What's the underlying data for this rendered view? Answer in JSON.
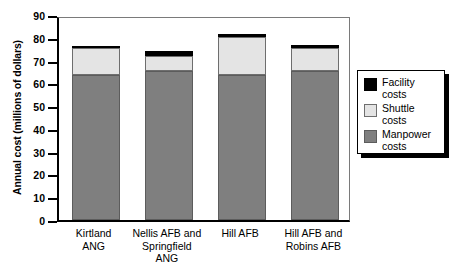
{
  "chart_data": {
    "type": "bar",
    "stacked": true,
    "title": "",
    "xlabel": "",
    "ylabel": "Annual cost (millions of dollars)",
    "ylim": [
      0,
      90
    ],
    "yticks": [
      90,
      80,
      70,
      60,
      50,
      40,
      30,
      20,
      10,
      0
    ],
    "grid": false,
    "legend_position": "right",
    "categories": [
      "Kirtland\nANG",
      "Nellis AFB and\nSpringfield\nANG",
      "Hill AFB",
      "Hill AFB and\nRobins AFB"
    ],
    "series": [
      {
        "name": "Manpower costs",
        "color": "#7f7f7f",
        "values": [
          63.5,
          65.5,
          63.5,
          65.5
        ]
      },
      {
        "name": "Shuttle costs",
        "color": "#e4e4e4",
        "values": [
          12.0,
          6.3,
          16.8,
          10.0
        ]
      },
      {
        "name": "Facility costs",
        "color": "#000000",
        "values": [
          1.0,
          2.2,
          1.5,
          1.5
        ]
      }
    ],
    "totals": [
      76.5,
      74.0,
      81.8,
      77.0
    ]
  },
  "legend": {
    "items": [
      {
        "label": "Facility\ncosts",
        "swatch": "facility"
      },
      {
        "label": "Shuttle\ncosts",
        "swatch": "shuttle"
      },
      {
        "label": "Manpower\ncosts",
        "swatch": "manpower"
      }
    ]
  },
  "axis": {
    "y_title": "Annual cost (millions of dollars)",
    "y_tick_labels": [
      "90",
      "80",
      "70",
      "60",
      "50",
      "40",
      "30",
      "20",
      "10",
      "0"
    ]
  }
}
